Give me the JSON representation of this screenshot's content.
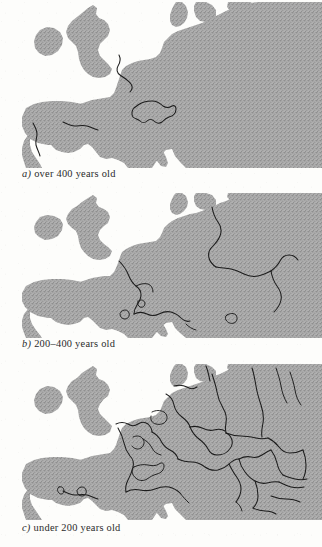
{
  "figure": {
    "kind": "three-panel map series",
    "land_color": "#a9a9a9",
    "sea_color": "#ffffff",
    "border_color": "#1c1c1c"
  },
  "panels": [
    {
      "id": "a",
      "label": "a)",
      "caption": "over 400 years old",
      "region": "Europe",
      "borders": [
        "France–Belgium / Low Countries frontier",
        "Switzerland outline",
        "Portugal–Spain frontier",
        "Spain–France (Pyrenees) frontier"
      ]
    },
    {
      "id": "b",
      "label": "b)",
      "caption": "200–400 years old",
      "region": "Europe",
      "borders": [
        "France eastern frontier",
        "Switzerland–Italy / Alpine frontier",
        "Germany–Poland / Baltic frontier",
        "Austria–Hungary / Carpathian frontier",
        "Danube frontier",
        "Andorra and small Pyrenean enclaves",
        "Montenegro / Adriatic frontier"
      ]
    },
    {
      "id": "c",
      "label": "c)",
      "caption": "under 200 years old",
      "region": "Europe",
      "borders": [
        "Dense network of modern Central and Eastern European state borders",
        "Balkan successor-state frontiers",
        "Baltic and Scandinavian frontiers",
        "Benelux and Alpine micro-state frontiers"
      ]
    }
  ]
}
